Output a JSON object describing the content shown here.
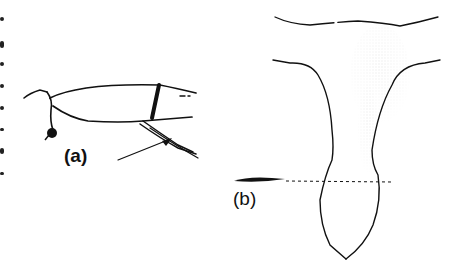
{
  "figure": {
    "panels": [
      {
        "id": "a",
        "label": "(a)",
        "description": "side view of appendage segment with seta indicated by arrow"
      },
      {
        "id": "b",
        "label": "(b)",
        "description": "T-shaped stippled structure tapering to pointed lens-shaped tip with dotted cross-section line"
      }
    ]
  },
  "colors": {
    "ink": "#111111",
    "background": "#ffffff"
  }
}
